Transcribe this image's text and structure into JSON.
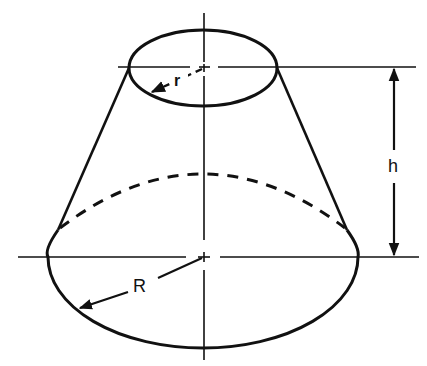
{
  "figure": {
    "type": "frustum-of-cone",
    "stroke_color": "#111111",
    "background": "#ffffff"
  },
  "labels": {
    "top_radius": "r",
    "bottom_radius": "R",
    "height": "h"
  },
  "geometry": {
    "top_ellipse": {
      "cx": 203,
      "cy": 68,
      "rx": 74,
      "ry": 38
    },
    "bottom_ellipse": {
      "cx": 203,
      "cy": 257,
      "rx": 155,
      "ry": 91
    },
    "axis": {
      "x": 204,
      "y1": 13,
      "y2": 360
    },
    "dimension_line_x": 394
  }
}
